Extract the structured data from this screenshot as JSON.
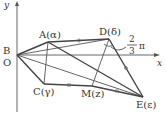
{
  "diagram": {
    "axes": {
      "x_label": "x",
      "y_label": "y",
      "origin_label": "O"
    },
    "points": {
      "B": {
        "label": "B",
        "x": 17,
        "y": 55
      },
      "A": {
        "label": "A(α)",
        "x": 48,
        "y": 42
      },
      "D": {
        "label": "D(δ)",
        "x": 109,
        "y": 39
      },
      "C": {
        "label": "C(γ)",
        "x": 44,
        "y": 84
      },
      "M": {
        "label": "M(z)",
        "x": 92,
        "y": 86
      },
      "E": {
        "label": "E(ε)",
        "x": 143,
        "y": 97
      }
    },
    "angle_annotation": {
      "at": "D",
      "numerator": "2",
      "denominator": "3",
      "suffix": "π"
    },
    "segments": [
      "B-A",
      "A-D",
      "D-E",
      "B-C",
      "C-M",
      "M-E",
      "A-C",
      "A-E",
      "B-D",
      "B-E",
      "D-M"
    ],
    "equal_marks": [
      "A-D",
      "D-E",
      "C-M",
      "M-E"
    ]
  }
}
